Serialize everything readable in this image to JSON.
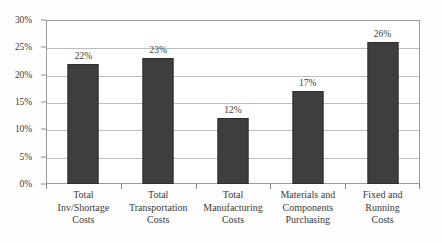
{
  "chart_data": {
    "type": "bar",
    "title": "",
    "subtitle": "",
    "xlabel": "",
    "ylabel": "",
    "ylim": [
      0,
      30
    ],
    "grid": true,
    "legend": false,
    "legend_position": "none",
    "y_tick_labels": [
      "0%",
      "5%",
      "10%",
      "15%",
      "20%",
      "25%",
      "30%"
    ],
    "y_ticks": [
      0,
      5,
      10,
      15,
      20,
      25,
      30
    ],
    "categories": [
      "Total Inv/Shortage Costs",
      "Total Transportation Costs",
      "Total Manufacturing Costs",
      "Materials and Components Purchasing",
      "Fixed and Running Costs"
    ],
    "category_lines": [
      [
        "Total",
        "Inv/Shortage",
        "Costs"
      ],
      [
        "Total",
        "Transportation",
        "Costs"
      ],
      [
        "Total",
        "Manufacturing",
        "Costs"
      ],
      [
        "Materials and",
        "Components",
        "Purchasing"
      ],
      [
        "Fixed and",
        "Running",
        "Costs"
      ]
    ],
    "values": [
      22,
      23,
      12,
      17,
      26
    ],
    "data_labels": [
      "22%",
      "23%",
      "12%",
      "17%",
      "26%"
    ],
    "bar_color": "#3e3e3e",
    "gridline_color": "#bdbdbd",
    "frame_color": "#9a9a9a",
    "background_color": "#ffffff",
    "text_color": "#3a3a3a"
  }
}
